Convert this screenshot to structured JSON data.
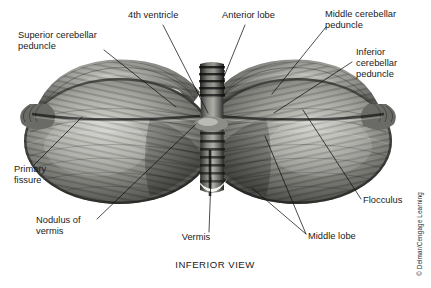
{
  "figure": {
    "caption": "INFERIOR VIEW",
    "credit": "© Delmar/Cengage Learning",
    "view": "inferior",
    "background_color": "#ffffff",
    "ink_color": "#1a1a1a"
  },
  "labels": [
    {
      "id": "superior-cerebellar-peduncle",
      "lines": [
        "Superior cerebellar",
        "peduncle"
      ],
      "text_x": 18,
      "text_y": 38,
      "anchor": "start",
      "leaders": [
        [
          [
            104,
            50
          ],
          [
            176,
            107
          ]
        ]
      ]
    },
    {
      "id": "fourth-ventricle",
      "lines": [
        "4th ventricle"
      ],
      "text_x": 128,
      "text_y": 18,
      "anchor": "start",
      "leaders": [
        [
          [
            163,
            25
          ],
          [
            208,
            113
          ]
        ]
      ]
    },
    {
      "id": "anterior-lobe",
      "lines": [
        "Anterior lobe"
      ],
      "text_x": 222,
      "text_y": 18,
      "anchor": "start",
      "leaders": [
        [
          [
            245,
            25
          ],
          [
            221,
            84
          ]
        ]
      ]
    },
    {
      "id": "middle-cerebellar-peduncle",
      "lines": [
        "Middle cerebellar",
        "peduncle"
      ],
      "text_x": 325,
      "text_y": 17,
      "anchor": "start",
      "leaders": [
        [
          [
            326,
            27
          ],
          [
            272,
            94
          ]
        ]
      ]
    },
    {
      "id": "inferior-cerebellar-peduncle",
      "lines": [
        "Inferior",
        "cerebellar",
        "peduncle"
      ],
      "text_x": 356,
      "text_y": 55,
      "anchor": "start",
      "leaders": [
        [
          [
            352,
            62
          ],
          [
            274,
            113
          ]
        ]
      ]
    },
    {
      "id": "primary-fissure",
      "lines": [
        "Primary",
        "fissure"
      ],
      "text_x": 14,
      "text_y": 172,
      "anchor": "start",
      "leaders": [
        [
          [
            34,
            165
          ],
          [
            82,
            117
          ]
        ]
      ]
    },
    {
      "id": "nodulus-of-vermis",
      "lines": [
        "Nodulus of",
        "vermis"
      ],
      "text_x": 36,
      "text_y": 223,
      "anchor": "start",
      "leaders": [
        [
          [
            97,
            219
          ],
          [
            196,
            124
          ]
        ]
      ]
    },
    {
      "id": "vermis",
      "lines": [
        "Vermis"
      ],
      "text_x": 196,
      "text_y": 240,
      "anchor": "middle",
      "leaders": [
        [
          [
            209,
            232
          ],
          [
            211,
            178
          ]
        ]
      ]
    },
    {
      "id": "middle-lobe",
      "lines": [
        "Middle lobe"
      ],
      "text_x": 308,
      "text_y": 239,
      "anchor": "start",
      "leaders": [
        [
          [
            306,
            234
          ],
          [
            265,
            136
          ]
        ],
        [
          [
            306,
            234
          ],
          [
            252,
            188
          ]
        ]
      ]
    },
    {
      "id": "flocculus",
      "lines": [
        "Flocculus"
      ],
      "text_x": 363,
      "text_y": 203,
      "anchor": "start",
      "leaders": [
        [
          [
            361,
            199
          ],
          [
            303,
            110
          ]
        ]
      ]
    }
  ],
  "anatomy": {
    "hemispheres": [
      {
        "id": "left-hemisphere",
        "cx": 119,
        "cy": 140,
        "rx": 94,
        "ry": 62
      },
      {
        "id": "right-hemisphere",
        "cx": 297,
        "cy": 140,
        "rx": 94,
        "ry": 62
      }
    ],
    "peduncle_patches": [
      {
        "id": "left-middle-cerebellar-peduncle",
        "cx": 156,
        "cy": 97,
        "rx": 24,
        "ry": 9,
        "color": "#f2f1ec"
      },
      {
        "id": "right-middle-cerebellar-peduncle",
        "cx": 274,
        "cy": 97,
        "rx": 24,
        "ry": 9,
        "color": "#f4f3ee"
      }
    ],
    "vermis": {
      "id": "vermis-column",
      "cx": 212,
      "top": 70,
      "bottom": 190,
      "width": 22
    },
    "brainstem_stub": {
      "cx": 212,
      "cy": 80,
      "rx": 13,
      "ry": 17
    },
    "tone_dark": "#3a3a3a",
    "tone_mid": "#7d7d7d",
    "tone_light": "#c9c9c4"
  }
}
